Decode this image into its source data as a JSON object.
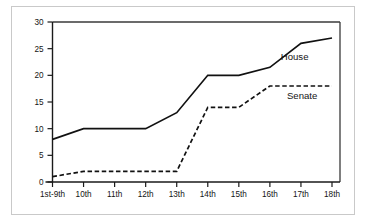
{
  "chart_data": {
    "type": "line",
    "title": "",
    "subtitle": "",
    "xlabel": "",
    "ylabel": "",
    "categories": [
      "1st-9th",
      "10th",
      "11th",
      "12th",
      "13th",
      "14th",
      "15th",
      "16th",
      "17th",
      "18th"
    ],
    "ylim": [
      0,
      30
    ],
    "yticks": [
      0,
      5,
      10,
      15,
      20,
      25,
      30
    ],
    "ytick_labels": [
      "0",
      "5",
      "10",
      "15",
      "20",
      "25",
      "30"
    ],
    "grid": false,
    "legend_position": "inline-right-of-series",
    "series": [
      {
        "name": "House",
        "style": "solid",
        "color": "#111111",
        "values": [
          8,
          10,
          10,
          10,
          13,
          20,
          20,
          21.5,
          26,
          27
        ]
      },
      {
        "name": "Senate",
        "style": "dashed",
        "color": "#111111",
        "values": [
          1,
          2,
          2,
          2,
          2,
          14,
          14,
          18,
          18,
          18
        ]
      }
    ],
    "annotations": [
      {
        "text": "House",
        "series": "House"
      },
      {
        "text": "Senate",
        "series": "Senate"
      }
    ]
  },
  "colors": {
    "outer_frame": "#c9c9c9",
    "axis": "#1a1a1a",
    "plot_frame": "#3a3a3a",
    "line": "#111111",
    "background": "#ffffff"
  }
}
